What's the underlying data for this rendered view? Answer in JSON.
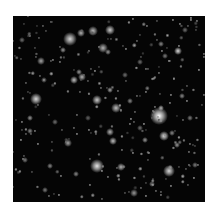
{
  "image": {
    "subject": "Deep field astronomical image of distant galaxies and stars",
    "background_color": "#050505",
    "frame_color": "#ffffff"
  },
  "objects": [
    {
      "x": 70,
      "y": 39,
      "r": 6,
      "b": 0.85,
      "type": "galaxy"
    },
    {
      "x": 81,
      "y": 33,
      "r": 3,
      "b": 0.7,
      "type": "galaxy"
    },
    {
      "x": 93,
      "y": 31,
      "r": 4,
      "b": 0.75,
      "type": "galaxy"
    },
    {
      "x": 110,
      "y": 30,
      "r": 4,
      "b": 0.8,
      "type": "galaxy"
    },
    {
      "x": 103,
      "y": 48,
      "r": 4,
      "b": 0.7,
      "type": "galaxy"
    },
    {
      "x": 108,
      "y": 52,
      "r": 2,
      "b": 0.6,
      "type": "star"
    },
    {
      "x": 63,
      "y": 50,
      "r": 2,
      "b": 0.6,
      "type": "star"
    },
    {
      "x": 41,
      "y": 61,
      "r": 3,
      "b": 0.65,
      "type": "galaxy"
    },
    {
      "x": 74,
      "y": 80,
      "r": 3,
      "b": 0.75,
      "type": "galaxy"
    },
    {
      "x": 82,
      "y": 77,
      "r": 3,
      "b": 0.7,
      "type": "galaxy"
    },
    {
      "x": 79,
      "y": 72,
      "r": 2,
      "b": 0.6,
      "type": "star"
    },
    {
      "x": 44,
      "y": 80,
      "r": 2,
      "b": 0.5,
      "type": "star"
    },
    {
      "x": 36,
      "y": 99,
      "r": 5,
      "b": 0.85,
      "type": "galaxy"
    },
    {
      "x": 97,
      "y": 100,
      "r": 4,
      "b": 0.8,
      "type": "galaxy"
    },
    {
      "x": 110,
      "y": 90,
      "r": 2,
      "b": 0.65,
      "type": "star"
    },
    {
      "x": 116,
      "y": 108,
      "r": 4,
      "b": 0.75,
      "type": "galaxy"
    },
    {
      "x": 130,
      "y": 101,
      "r": 2,
      "b": 0.55,
      "type": "star"
    },
    {
      "x": 159,
      "y": 116,
      "r": 8,
      "b": 1.0,
      "type": "galaxy"
    },
    {
      "x": 161,
      "y": 108,
      "r": 2,
      "b": 0.7,
      "type": "star"
    },
    {
      "x": 178,
      "y": 51,
      "r": 3,
      "b": 0.85,
      "type": "star"
    },
    {
      "x": 161,
      "y": 44,
      "r": 2,
      "b": 0.55,
      "type": "star"
    },
    {
      "x": 165,
      "y": 56,
      "r": 2,
      "b": 0.5,
      "type": "star"
    },
    {
      "x": 182,
      "y": 96,
      "r": 2,
      "b": 0.55,
      "type": "star"
    },
    {
      "x": 30,
      "y": 118,
      "r": 2,
      "b": 0.6,
      "type": "star"
    },
    {
      "x": 30,
      "y": 131,
      "r": 2,
      "b": 0.55,
      "type": "star"
    },
    {
      "x": 110,
      "y": 132,
      "r": 3,
      "b": 0.7,
      "type": "galaxy"
    },
    {
      "x": 113,
      "y": 141,
      "r": 3,
      "b": 0.75,
      "type": "galaxy"
    },
    {
      "x": 68,
      "y": 143,
      "r": 3,
      "b": 0.65,
      "type": "galaxy"
    },
    {
      "x": 145,
      "y": 140,
      "r": 2,
      "b": 0.6,
      "type": "star"
    },
    {
      "x": 164,
      "y": 136,
      "r": 4,
      "b": 0.85,
      "type": "galaxy"
    },
    {
      "x": 177,
      "y": 145,
      "r": 2,
      "b": 0.6,
      "type": "star"
    },
    {
      "x": 172,
      "y": 133,
      "r": 2,
      "b": 0.55,
      "type": "star"
    },
    {
      "x": 97,
      "y": 166,
      "r": 6,
      "b": 0.9,
      "type": "galaxy"
    },
    {
      "x": 121,
      "y": 167,
      "r": 3,
      "b": 0.7,
      "type": "galaxy"
    },
    {
      "x": 169,
      "y": 171,
      "r": 5,
      "b": 0.85,
      "type": "galaxy"
    },
    {
      "x": 152,
      "y": 184,
      "r": 2,
      "b": 0.55,
      "type": "star"
    },
    {
      "x": 134,
      "y": 193,
      "r": 3,
      "b": 0.6,
      "type": "galaxy"
    },
    {
      "x": 76,
      "y": 174,
      "r": 2,
      "b": 0.55,
      "type": "star"
    },
    {
      "x": 50,
      "y": 166,
      "r": 2,
      "b": 0.55,
      "type": "star"
    },
    {
      "x": 25,
      "y": 160,
      "r": 2,
      "b": 0.5,
      "type": "star"
    },
    {
      "x": 45,
      "y": 190,
      "r": 2,
      "b": 0.5,
      "type": "star"
    },
    {
      "x": 190,
      "y": 118,
      "r": 2,
      "b": 0.5,
      "type": "star"
    },
    {
      "x": 195,
      "y": 165,
      "r": 2,
      "b": 0.5,
      "type": "star"
    },
    {
      "x": 140,
      "y": 62,
      "r": 2,
      "b": 0.45,
      "type": "star"
    },
    {
      "x": 125,
      "y": 75,
      "r": 2,
      "b": 0.45,
      "type": "star"
    },
    {
      "x": 22,
      "y": 40,
      "r": 2,
      "b": 0.45,
      "type": "star"
    },
    {
      "x": 185,
      "y": 30,
      "r": 2,
      "b": 0.45,
      "type": "star"
    },
    {
      "x": 55,
      "y": 122,
      "r": 2,
      "b": 0.45,
      "type": "star"
    },
    {
      "x": 140,
      "y": 128,
      "r": 2,
      "b": 0.45,
      "type": "star"
    },
    {
      "x": 88,
      "y": 118,
      "r": 2,
      "b": 0.4,
      "type": "star"
    }
  ],
  "noise_seed": 7,
  "noise_count": 260
}
